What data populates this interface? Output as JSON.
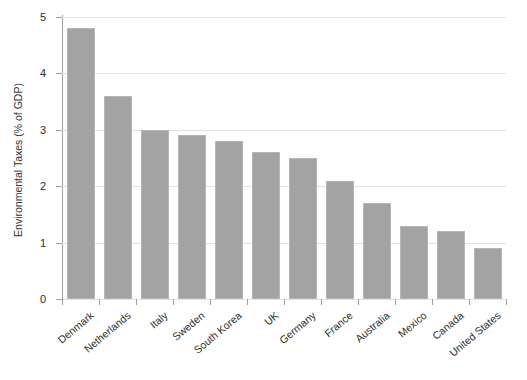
{
  "chart_data": {
    "type": "bar",
    "title": "",
    "xlabel": "",
    "ylabel": "Environmental Taxes (% of GDP)",
    "ylim": [
      0,
      5
    ],
    "yticks": [
      "0",
      "1",
      "2",
      "3",
      "4",
      "5"
    ],
    "grid": true,
    "legend": "none",
    "bar_color": "#a3a3a3",
    "categories": [
      "Denmark",
      "Netherlands",
      "Italy",
      "Sweden",
      "South Korea",
      "UK",
      "Germany",
      "France",
      "Australia",
      "Mexico",
      "Canada",
      "United States"
    ],
    "values": [
      4.8,
      3.6,
      3.0,
      2.9,
      2.8,
      2.6,
      2.5,
      2.1,
      1.7,
      1.3,
      1.2,
      0.9
    ]
  }
}
